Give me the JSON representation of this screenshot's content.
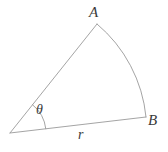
{
  "diagram": {
    "type": "circular-sector",
    "background_color": "#ffffff",
    "stroke_color": "#9a9a9a",
    "label_color": "#3a3a3a",
    "stroke_width": 0.9,
    "geometry": {
      "center": {
        "x": 10,
        "y": 133
      },
      "point_A": {
        "x": 97,
        "y": 24
      },
      "point_B": {
        "x": 146,
        "y": 117
      },
      "radius": 139,
      "angle_arc_radius": 36,
      "arc_sweep_description": "arc from A to B bulging outward to the right"
    },
    "labels": {
      "vertex_a": "A",
      "vertex_b": "B",
      "angle": "θ",
      "radius": "r"
    }
  }
}
